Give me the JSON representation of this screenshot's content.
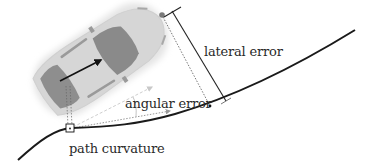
{
  "diagram": {
    "type": "vehicle-path-tracking",
    "labels": {
      "lateral_error": "lateral error",
      "angular_error": "angular error",
      "path_curvature": "path curvature"
    },
    "colors": {
      "background": "#ffffff",
      "path": "#1a1a1a",
      "car_body": "#d4d4d4",
      "car_glass": "#8a8a8a",
      "car_shadow": "#e6e6e6",
      "heading_arrow": "#111111",
      "lateral_error_line": "#222222",
      "angular_arrow_light": "#c8c8c8",
      "angular_arrow_dark": "#8c8c8c",
      "text": "#2a2a2a"
    },
    "elements": [
      "car",
      "heading-arrow",
      "path-curve",
      "lateral-error-bar",
      "nose-projection-dotted-line",
      "rear-projection-dotted-line",
      "right-angle-marker",
      "angular-error-arrows"
    ]
  }
}
